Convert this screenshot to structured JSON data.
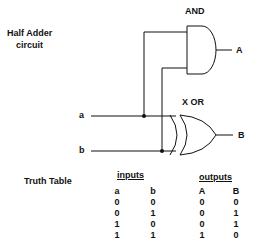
{
  "title_line1": "Half Adder",
  "title_line2": "circuit",
  "gates": {
    "and_label": "AND",
    "xor_label": "X OR"
  },
  "signals": {
    "input_a": "a",
    "input_b": "b",
    "output_A": "A",
    "output_B": "B"
  },
  "truth_table": {
    "label": "Truth Table",
    "inputs_header": "inputs",
    "outputs_header": "outputs",
    "columns": [
      "a",
      "b",
      "A",
      "B"
    ],
    "rows": [
      [
        "0",
        "0",
        "0",
        "0"
      ],
      [
        "0",
        "1",
        "0",
        "1"
      ],
      [
        "1",
        "0",
        "0",
        "1"
      ],
      [
        "1",
        "1",
        "1",
        "0"
      ]
    ]
  }
}
